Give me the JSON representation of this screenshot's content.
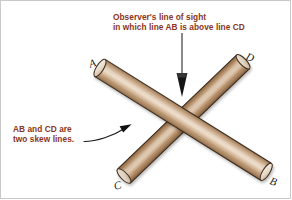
{
  "figure": {
    "title_note": "Observer's line of sight\nin which line AB is above line CD",
    "annotations": {
      "observer_note_line1": "Observer's line of sight",
      "observer_note_line2": "in which line AB is above line CD",
      "skew_note_line1": "AB and CD are",
      "skew_note_line2": "two skew lines."
    },
    "point_labels": {
      "a": "A",
      "b": "B",
      "c": "C",
      "d": "D"
    },
    "colors": {
      "annotation_text": "#8a3520",
      "label_text": "#1b1b1b",
      "rod_ab_light": "#e3cdb6",
      "rod_ab_mid": "#c4a183",
      "rod_ab_dark": "#9b7453",
      "rod_cd_light": "#d9c0a6",
      "rod_cd_mid": "#b08a66",
      "rod_cd_dark": "#7e5a3c",
      "outline": "#3a2a1c",
      "arrow": "#1a1a1a",
      "arrow_shaft": "#6b6b6b",
      "background": "#ffffff",
      "border": "#c9c9c9"
    },
    "geometry": {
      "rod_ab_start": [
        100,
        68
      ],
      "rod_ab_end": [
        266,
        172
      ],
      "rod_cd_start": [
        124,
        176
      ],
      "rod_cd_end": [
        243,
        62
      ],
      "crossing_point": [
        181,
        120
      ],
      "sight_arrow_from": [
        182,
        33
      ],
      "sight_arrow_to": [
        182,
        97
      ],
      "skew_arrow_from": [
        84,
        141
      ],
      "skew_arrow_to": [
        131,
        125
      ]
    }
  }
}
